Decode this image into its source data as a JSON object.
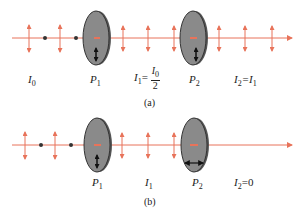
{
  "colors": {
    "beam": "#e8735a",
    "polarizer_fill": "#8a8a8a",
    "polarizer_edge": "#333333",
    "text": "#222222"
  },
  "panel_a": {
    "caption": "(a)",
    "labels": {
      "I0": "I",
      "I0_sub": "0",
      "P1": "P",
      "P1_sub": "1",
      "I1": "I",
      "I1_sub": "1",
      "I1_eq": "=",
      "I1_frac_num": "I",
      "I1_frac_num_sub": "0",
      "I1_frac_den": "2",
      "P2": "P",
      "P2_sub": "2",
      "I2": "I",
      "I2_sub": "2",
      "I2_eq": "=I",
      "I2_eq_sub": "1"
    },
    "polarizer_axes": [
      "vertical",
      "vertical"
    ]
  },
  "panel_b": {
    "caption": "(b)",
    "labels": {
      "P1": "P",
      "P1_sub": "1",
      "I1": "I",
      "I1_sub": "1",
      "P2": "P",
      "P2_sub": "2",
      "I2": "I",
      "I2_sub": "2",
      "I2_eq": "=0"
    },
    "polarizer_axes": [
      "vertical",
      "horizontal"
    ]
  }
}
